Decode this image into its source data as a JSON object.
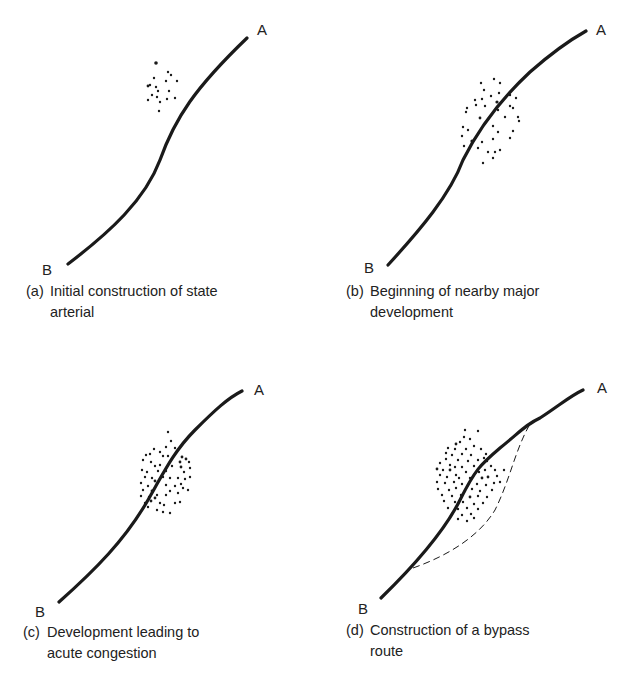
{
  "figure": {
    "panels": [
      {
        "id": "a",
        "tag": "(a)",
        "caption_line1": "Initial construction of state",
        "caption_line2": "arterial",
        "end_a": "A",
        "end_b": "B"
      },
      {
        "id": "b",
        "tag": "(b)",
        "caption_line1": "Beginning of nearby major",
        "caption_line2": "development",
        "end_a": "A",
        "end_b": "B"
      },
      {
        "id": "c",
        "tag": "(c)",
        "caption_line1": "Development leading to",
        "caption_line2": "acute congestion",
        "end_a": "A",
        "end_b": "B"
      },
      {
        "id": "d",
        "tag": "(d)",
        "caption_line1": "Construction of a bypass",
        "caption_line2": "route",
        "end_a": "A",
        "end_b": "B"
      }
    ]
  },
  "colors": {
    "ink": "#1a1a1a",
    "background": "#ffffff"
  }
}
